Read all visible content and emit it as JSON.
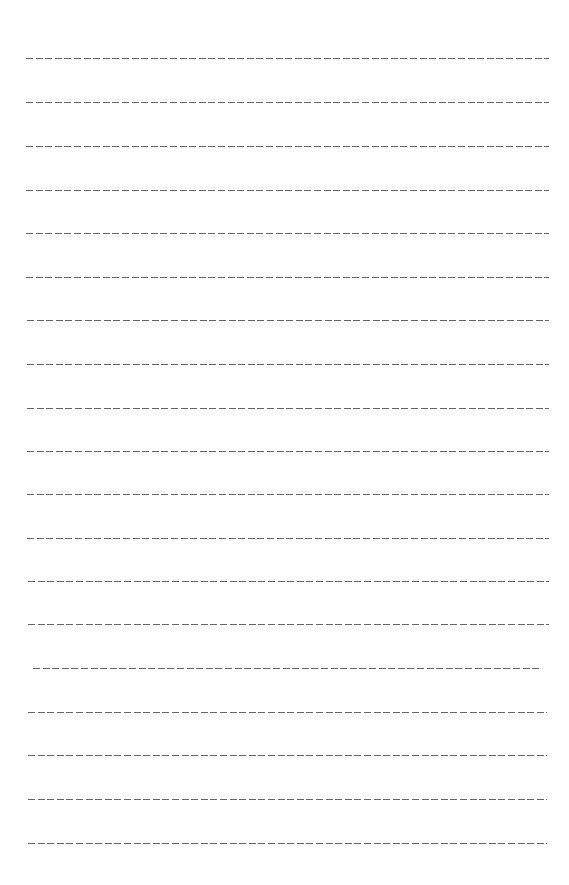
{
  "page": {
    "type": "blank-ruled-sheet",
    "line_style": "dashed",
    "line_color": "#4a4a4a",
    "line_count": 19,
    "lines": [
      {
        "y": 58,
        "x1": 26,
        "x2": 549
      },
      {
        "y": 102,
        "x1": 26,
        "x2": 549
      },
      {
        "y": 146,
        "x1": 26,
        "x2": 549
      },
      {
        "y": 190,
        "x1": 26,
        "x2": 549
      },
      {
        "y": 233,
        "x1": 26,
        "x2": 549
      },
      {
        "y": 277,
        "x1": 26,
        "x2": 549
      },
      {
        "y": 320,
        "x1": 27,
        "x2": 549
      },
      {
        "y": 364,
        "x1": 27,
        "x2": 549
      },
      {
        "y": 408,
        "x1": 27,
        "x2": 549
      },
      {
        "y": 451,
        "x1": 27,
        "x2": 549
      },
      {
        "y": 494,
        "x1": 27,
        "x2": 549
      },
      {
        "y": 538,
        "x1": 27,
        "x2": 549
      },
      {
        "y": 581,
        "x1": 28,
        "x2": 549
      },
      {
        "y": 624,
        "x1": 28,
        "x2": 549
      },
      {
        "y": 668,
        "x1": 33,
        "x2": 541
      },
      {
        "y": 712,
        "x1": 28,
        "x2": 547
      },
      {
        "y": 755,
        "x1": 28,
        "x2": 547
      },
      {
        "y": 799,
        "x1": 28,
        "x2": 547
      },
      {
        "y": 843,
        "x1": 28,
        "x2": 547
      }
    ]
  }
}
